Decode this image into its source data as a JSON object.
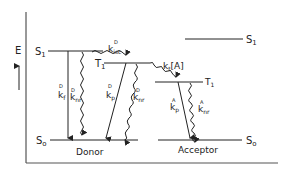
{
  "axis": {
    "label": "E"
  },
  "donor": {
    "name": "Donor",
    "levels": {
      "S1": "S",
      "S1_sub": "1",
      "T1": "T",
      "T1_sub": "1",
      "S0": "S",
      "S0_sub": "o"
    },
    "rates": {
      "kf": {
        "base": "k",
        "sub": "f",
        "sup": "D"
      },
      "knr_s": {
        "base": "k",
        "sub": "nr",
        "sup": "D"
      },
      "kisc": {
        "base": "k",
        "sub": "isc",
        "sup": "D"
      },
      "kp": {
        "base": "k",
        "sub": "p",
        "sup": "D"
      },
      "knr_t": {
        "base": "k",
        "sub": "nr",
        "sup": "D"
      }
    }
  },
  "transfer": {
    "label": "k",
    "sub": "t",
    "suffix": "[A]"
  },
  "acceptor": {
    "name": "Acceptor",
    "levels": {
      "S1": "S",
      "S1_sub": "1",
      "T1": "T",
      "T1_sub": "1",
      "S0": "S",
      "S0_sub": "o"
    },
    "rates": {
      "kp": {
        "base": "k",
        "sub": "p",
        "sup": "A"
      },
      "knr": {
        "base": "k",
        "sub": "nr",
        "sup": "A"
      }
    }
  }
}
